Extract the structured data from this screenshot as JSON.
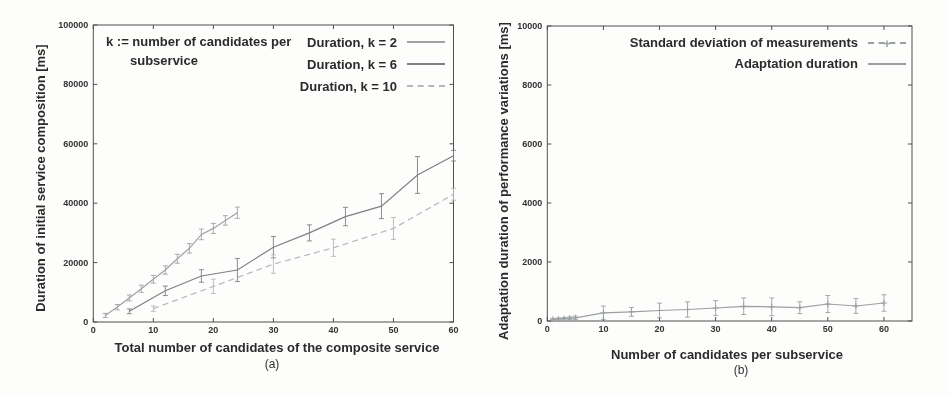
{
  "colors": {
    "frame": "#4f4f4f",
    "tick_label": "#333333",
    "text": "#2b2b2b",
    "series_k2": "#9fa3a6",
    "series_k6": "#7c8184",
    "series_k10": "#b4b8ba",
    "series_adaptation": "#9aa0a3"
  },
  "chart_data": [
    {
      "panel": "a",
      "type": "line",
      "caption": "(a)",
      "xlabel": "Total number of candidates of the composite service",
      "ylabel": "Duration of initial service composition [ms]",
      "annotation": "k := number of candidates per subservice",
      "xlim": [
        0,
        60
      ],
      "ylim": [
        0,
        100000
      ],
      "x_ticks": [
        0,
        10,
        20,
        30,
        40,
        50,
        60
      ],
      "y_ticks": [
        0,
        20000,
        40000,
        60000,
        80000,
        100000
      ],
      "grid": false,
      "legend_position": "top-right",
      "error_bars": true,
      "series": [
        {
          "name": "Duration, k = 2",
          "color": "#9fa3a6",
          "dash": false,
          "x": [
            2,
            4,
            6,
            8,
            10,
            12,
            14,
            16,
            18,
            20,
            22,
            24
          ],
          "y": [
            2200,
            5000,
            8100,
            11200,
            14400,
            17500,
            21300,
            24800,
            29500,
            31500,
            34200,
            36800
          ],
          "yerr": [
            700,
            900,
            1000,
            1200,
            1300,
            1400,
            1500,
            1600,
            1800,
            1700,
            1600,
            1900
          ]
        },
        {
          "name": "Duration, k = 6",
          "color": "#7c8184",
          "dash": false,
          "x": [
            6,
            12,
            18,
            24,
            30,
            36,
            42,
            48,
            54,
            60
          ],
          "y": [
            3600,
            10500,
            15500,
            17500,
            25200,
            30000,
            35500,
            39000,
            49500,
            56000
          ],
          "yerr": [
            800,
            1600,
            2100,
            3900,
            3600,
            2700,
            3100,
            4200,
            6200,
            1800
          ]
        },
        {
          "name": "Duration, k = 10",
          "color": "#b4b8ba",
          "dash": true,
          "x": [
            10,
            20,
            30,
            40,
            50,
            60
          ],
          "y": [
            4500,
            12000,
            19500,
            25000,
            31500,
            43000
          ],
          "yerr": [
            900,
            2400,
            3100,
            2900,
            3700,
            2000
          ]
        }
      ]
    },
    {
      "panel": "b",
      "type": "line",
      "caption": "(b)",
      "xlabel": "Number of candidates per subservice",
      "ylabel": "Adaptation duration of performance variations [ms]",
      "xlim": [
        0,
        65
      ],
      "ylim": [
        0,
        10000
      ],
      "x_ticks": [
        0,
        10,
        20,
        30,
        40,
        50,
        60
      ],
      "y_ticks": [
        0,
        2000,
        4000,
        6000,
        8000,
        10000
      ],
      "grid": false,
      "legend_position": "top-right",
      "error_bars": true,
      "legend": [
        "Standard deviation of measurements",
        "Adaptation duration"
      ],
      "series": [
        {
          "name": "Adaptation duration",
          "color": "#9aa0a3",
          "dash": false,
          "marker": "plus",
          "x": [
            1,
            2,
            3,
            4,
            5,
            10,
            15,
            20,
            25,
            30,
            35,
            40,
            45,
            50,
            55,
            60
          ],
          "y": [
            60,
            70,
            80,
            95,
            110,
            275,
            310,
            355,
            390,
            440,
            500,
            480,
            450,
            575,
            510,
            610
          ],
          "yerr": [
            30,
            35,
            40,
            45,
            55,
            230,
            150,
            250,
            260,
            250,
            280,
            300,
            200,
            290,
            250,
            280
          ]
        }
      ]
    }
  ]
}
